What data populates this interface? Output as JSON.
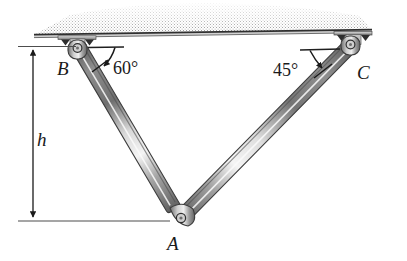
{
  "figure": {
    "labels": {
      "point_b": "B",
      "point_c": "C",
      "point_a": "A",
      "height": "h",
      "angle_left": "60°",
      "angle_right": "45°"
    },
    "colors": {
      "ink": "#1a1a1a",
      "line": "#4a4a4a",
      "metal_light": "#f2f2f2",
      "metal_mid": "#9a9a9a",
      "metal_dark": "#5c5c5c",
      "hatch": "#b8b8b8",
      "ceiling_line": "#3a3a3a"
    },
    "geometry": {
      "ceiling_y": 34,
      "pin_b": [
        76,
        46
      ],
      "pin_c": [
        352,
        46
      ],
      "pin_a": [
        182,
        220
      ],
      "angle_left_deg": 60,
      "angle_right_deg": 45,
      "dimension_x": 33,
      "dimension_top_y": 46,
      "dimension_bottom_y": 220
    }
  }
}
